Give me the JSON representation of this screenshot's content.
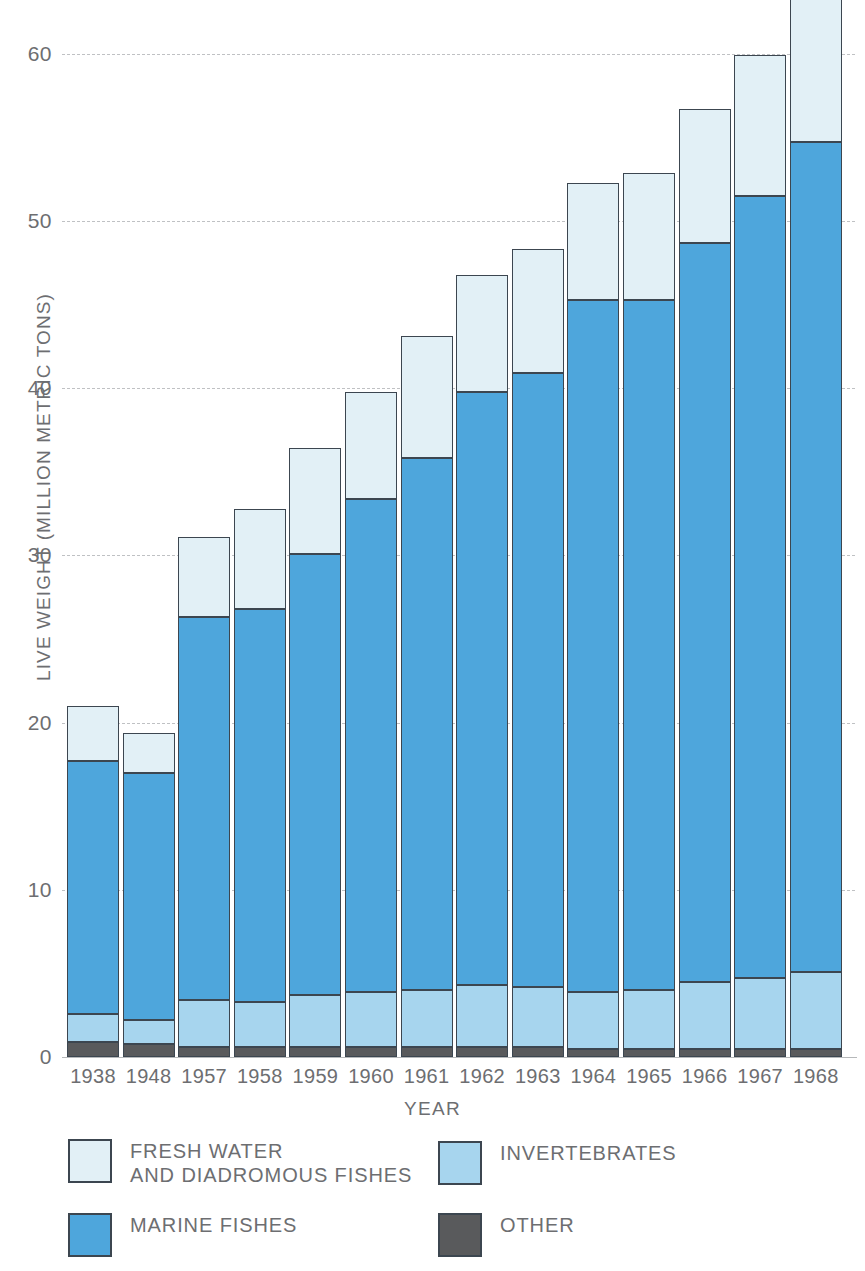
{
  "chart_data": {
    "type": "bar",
    "subtype": "stacked-bar",
    "title": "",
    "xlabel": "YEAR",
    "ylabel": "LIVE WEIGHT (MILLION METRIC TONS)",
    "ylim": [
      0,
      64
    ],
    "yticks": [
      0,
      10,
      20,
      30,
      40,
      50,
      60
    ],
    "ytick_labels": [
      "0",
      "10",
      "20",
      "30",
      "40",
      "50",
      "60"
    ],
    "grid": true,
    "legend_position": "bottom",
    "categories": [
      "1938",
      "1948",
      "1957",
      "1958",
      "1959",
      "1960",
      "1961",
      "1962",
      "1963",
      "1964",
      "1965",
      "1966",
      "1967",
      "1968"
    ],
    "stack_order_bottom_to_top": [
      "OTHER",
      "INVERTEBRATES",
      "MARINE FISHES",
      "FRESH WATER AND DIADROMOUS FISHES"
    ],
    "series": [
      {
        "name": "OTHER",
        "color": "#595a5c",
        "values": [
          0.9,
          0.8,
          0.6,
          0.6,
          0.6,
          0.6,
          0.6,
          0.6,
          0.6,
          0.5,
          0.5,
          0.5,
          0.5,
          0.5
        ]
      },
      {
        "name": "INVERTEBRATES",
        "color": "#a7d5ee",
        "values": [
          1.7,
          1.4,
          2.8,
          2.7,
          3.1,
          3.3,
          3.4,
          3.7,
          3.6,
          3.4,
          3.5,
          4.0,
          4.2,
          4.6
        ]
      },
      {
        "name": "MARINE FISHES",
        "color": "#4ea6dc",
        "values": [
          15.1,
          14.8,
          22.9,
          23.5,
          26.4,
          29.5,
          31.8,
          35.5,
          36.7,
          41.4,
          41.3,
          44.2,
          46.8,
          49.6
        ]
      },
      {
        "name": "FRESH WATER AND DIADROMOUS FISHES",
        "color": "#e2f0f6",
        "values": [
          3.3,
          2.4,
          4.8,
          6.0,
          6.3,
          6.4,
          7.3,
          7.0,
          7.4,
          7.0,
          7.6,
          8.0,
          8.4,
          8.8
        ]
      }
    ],
    "totals": [
      21.0,
      19.4,
      31.1,
      32.8,
      36.4,
      39.8,
      43.1,
      46.8,
      48.3,
      52.3,
      52.9,
      56.7,
      59.9,
      63.5
    ]
  },
  "axis": {
    "y_title": "LIVE WEIGHT (MILLION METRIC TONS)",
    "x_title": "YEAR"
  },
  "legend": {
    "items": [
      {
        "label": "FRESH WATER\nAND DIADROMOUS FISHES",
        "swatch": "fresh",
        "color": "#e2f0f6"
      },
      {
        "label": "INVERTEBRATES",
        "swatch": "inverts",
        "color": "#a7d5ee"
      },
      {
        "label": "MARINE FISHES",
        "swatch": "marine",
        "color": "#4ea6dc"
      },
      {
        "label": "OTHER",
        "swatch": "other",
        "color": "#595a5c"
      }
    ]
  }
}
